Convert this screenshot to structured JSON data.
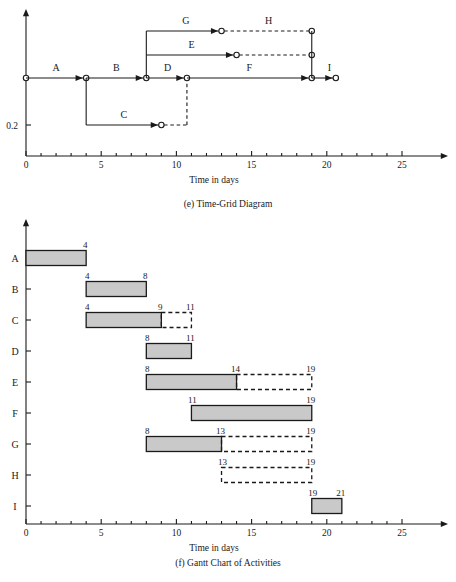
{
  "figure": {
    "width": 456,
    "height": 582,
    "background": "#ffffff",
    "line_color": "#1a1a1a",
    "bar_fill": "#c9c9c9",
    "bar_stroke": "#1a1a1a"
  },
  "panel_e": {
    "caption": "(e) Time-Grid Diagram",
    "axis_title": "Time in days",
    "y_tick_label": "0.2",
    "x_axis": {
      "min": 0,
      "max": 27,
      "tick_step": 1,
      "major_step": 5,
      "labels": [
        "0",
        "5",
        "10",
        "15",
        "20",
        "25"
      ],
      "label_values": [
        0,
        5,
        10,
        15,
        20,
        25
      ]
    },
    "activities": [
      {
        "name": "A",
        "row": "main",
        "start": 0,
        "end": 4,
        "type": "solid",
        "float_end": 4
      },
      {
        "name": "B",
        "row": "main",
        "start": 4,
        "end": 8,
        "type": "solid",
        "float_end": 8
      },
      {
        "name": "C",
        "row": "c",
        "start": 4,
        "end": 9,
        "type": "solid",
        "float_end": 11
      },
      {
        "name": "D",
        "row": "main",
        "start": 8,
        "end": 10.7,
        "type": "solid",
        "float_end": 10.7
      },
      {
        "name": "E",
        "row": "e",
        "start": 8,
        "end": 14,
        "type": "solid",
        "float_end": 19
      },
      {
        "name": "F",
        "row": "main",
        "start": 10.7,
        "end": 19,
        "type": "solid",
        "float_end": 19
      },
      {
        "name": "G",
        "row": "g",
        "start": 8,
        "end": 13,
        "type": "solid",
        "float_end": 19
      },
      {
        "name": "H",
        "row": "g",
        "start": 13,
        "end": 19,
        "type": "dashed",
        "float_end": 19
      },
      {
        "name": "I",
        "row": "main",
        "start": 19,
        "end": 20.6,
        "type": "solid",
        "float_end": 20.6
      }
    ]
  },
  "panel_f": {
    "caption": "(f) Gantt Chart of Activities",
    "axis_title": "Time in days",
    "x_axis": {
      "min": 0,
      "max": 27,
      "tick_step": 1,
      "major_step": 5,
      "labels": [
        "0",
        "5",
        "10",
        "15",
        "20",
        "25"
      ],
      "label_values": [
        0,
        5,
        10,
        15,
        20,
        25
      ]
    },
    "rows": [
      "A",
      "B",
      "C",
      "D",
      "E",
      "F",
      "G",
      "H",
      "I"
    ],
    "bars": [
      {
        "name": "A",
        "start": 0,
        "end": 4,
        "float_end": 4,
        "start_label": "",
        "end_label": "4",
        "float_label": ""
      },
      {
        "name": "B",
        "start": 4,
        "end": 8,
        "float_end": 8,
        "start_label": "4",
        "end_label": "8",
        "float_label": ""
      },
      {
        "name": "C",
        "start": 4,
        "end": 9,
        "float_end": 11,
        "start_label": "4",
        "end_label": "9",
        "float_label": "11"
      },
      {
        "name": "D",
        "start": 8,
        "end": 11,
        "float_end": 11,
        "start_label": "8",
        "end_label": "11",
        "float_label": ""
      },
      {
        "name": "E",
        "start": 8,
        "end": 14,
        "float_end": 19,
        "start_label": "8",
        "end_label": "14",
        "float_label": "19"
      },
      {
        "name": "F",
        "start": 11,
        "end": 19,
        "float_end": 19,
        "start_label": "11",
        "end_label": "19",
        "float_label": ""
      },
      {
        "name": "G",
        "start": 8,
        "end": 13,
        "float_end": 19,
        "start_label": "8",
        "end_label": "13",
        "float_label": "19"
      },
      {
        "name": "H",
        "start": 13,
        "end": 19,
        "float_end": 19,
        "start_label": "13",
        "end_label": "19",
        "float_label": "",
        "bar_dashed": true
      },
      {
        "name": "I",
        "start": 19,
        "end": 21,
        "float_end": 21,
        "start_label": "19",
        "end_label": "21",
        "float_label": ""
      }
    ]
  }
}
